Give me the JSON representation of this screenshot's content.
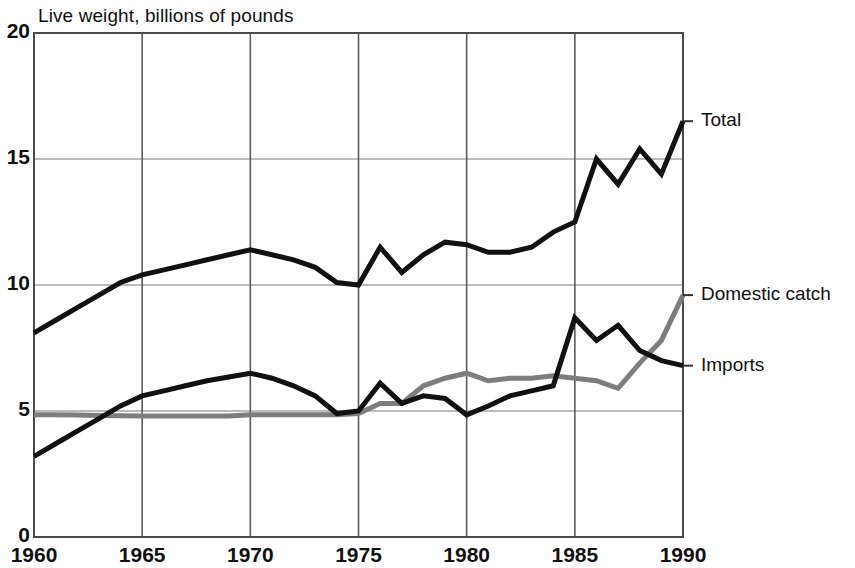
{
  "chart_data": {
    "type": "line",
    "title": "Live weight, billions of pounds",
    "xlabel": "",
    "ylabel": "Live weight, billions of pounds",
    "xlim": [
      1960,
      1990
    ],
    "ylim": [
      0,
      20
    ],
    "grid": true,
    "legend_position": "right-inline-labels",
    "x_ticks": [
      "1960",
      "1965",
      "1970",
      "1975",
      "1980",
      "1985",
      "1990"
    ],
    "x_tick_values": [
      1960,
      1965,
      1970,
      1975,
      1980,
      1985,
      1990
    ],
    "y_ticks": [
      "0",
      "5",
      "10",
      "15",
      "20"
    ],
    "y_tick_values": [
      0,
      5,
      10,
      15,
      20
    ],
    "x": [
      1960,
      1961,
      1962,
      1963,
      1964,
      1965,
      1966,
      1967,
      1968,
      1969,
      1970,
      1971,
      1972,
      1973,
      1974,
      1975,
      1976,
      1977,
      1978,
      1979,
      1980,
      1981,
      1982,
      1983,
      1984,
      1985,
      1986,
      1987,
      1988,
      1989,
      1990
    ],
    "series": [
      {
        "name": "Total",
        "color": "#111111",
        "width": 5,
        "label_value": 16.5,
        "values": [
          8.1,
          8.6,
          9.1,
          9.6,
          10.1,
          10.4,
          10.6,
          10.8,
          11.0,
          11.2,
          11.4,
          11.2,
          11.0,
          10.7,
          10.1,
          10.0,
          11.5,
          10.5,
          11.2,
          11.7,
          11.6,
          11.3,
          11.3,
          11.5,
          12.1,
          12.5,
          15.0,
          14.0,
          15.4,
          14.4,
          16.5
        ]
      },
      {
        "name": "Domestic catch",
        "color": "#7d7d7d",
        "width": 5,
        "label_value": 9.6,
        "values": [
          4.85,
          4.85,
          4.84,
          4.82,
          4.81,
          4.8,
          4.8,
          4.8,
          4.8,
          4.8,
          4.85,
          4.85,
          4.85,
          4.85,
          4.85,
          4.9,
          5.3,
          5.3,
          6.0,
          6.3,
          6.5,
          6.2,
          6.3,
          6.3,
          6.4,
          6.3,
          6.2,
          5.9,
          6.9,
          7.8,
          9.6
        ]
      },
      {
        "name": "Imports",
        "color": "#111111",
        "width": 5,
        "label_value": 6.8,
        "values": [
          3.2,
          3.7,
          4.2,
          4.7,
          5.2,
          5.6,
          5.8,
          6.0,
          6.2,
          6.35,
          6.5,
          6.3,
          6.0,
          5.6,
          4.9,
          5.0,
          6.1,
          5.3,
          5.6,
          5.5,
          4.85,
          5.2,
          5.6,
          5.8,
          6.0,
          8.7,
          7.8,
          8.4,
          7.4,
          7.0,
          6.8
        ]
      }
    ]
  },
  "labels": {
    "total": "Total",
    "domestic_catch": "Domestic catch",
    "imports": "Imports"
  },
  "geometry": {
    "plot_left": 34,
    "plot_right": 683,
    "plot_top": 33,
    "plot_bottom": 537,
    "tick_out": 10
  }
}
